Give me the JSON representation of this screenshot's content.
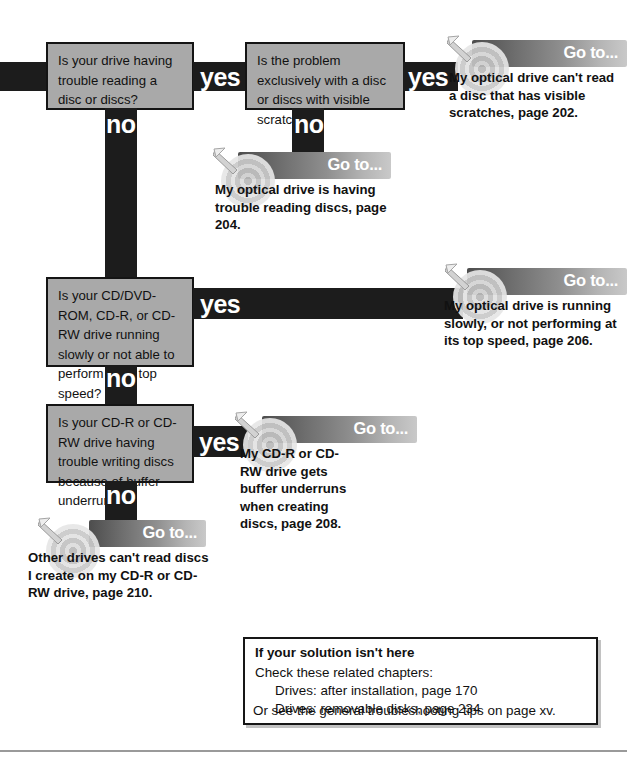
{
  "page": {
    "flow_type": "troubleshooting-flowchart",
    "topic": "Optical drive problems"
  },
  "decisions": [
    {
      "id": "q1",
      "text": "Is your drive having trouble reading a disc or discs?",
      "yes_label": "yes",
      "no_label": "no"
    },
    {
      "id": "q2",
      "text": "Is the problem exclusively with a disc or discs with visible scratches?",
      "yes_label": "yes",
      "no_label": "no"
    },
    {
      "id": "q3",
      "text": "Is your CD/DVD-ROM, CD-R, or CD-RW drive running slowly or not able to perform at its top speed?",
      "yes_label": "yes",
      "no_label": "no"
    },
    {
      "id": "q4",
      "text": "Is your CD-R or CD-RW drive having trouble writing discs because of buffer underruns?",
      "yes_label": "yes",
      "no_label": "no"
    }
  ],
  "outcomes": [
    {
      "id": "out1",
      "header": "Go to...",
      "body": "My optical drive can't read a disc that has visible scratches, page 202.",
      "icon": "target-dart-icon"
    },
    {
      "id": "out2",
      "header": "Go to...",
      "body": "My optical drive is having trouble reading discs, page 204.",
      "icon": "target-dart-icon"
    },
    {
      "id": "out3",
      "header": "Go to...",
      "body": "My optical drive is running slowly, or not performing at its top speed, page 206.",
      "icon": "target-dart-icon"
    },
    {
      "id": "out4",
      "header": "Go to...",
      "body": "My CD-R or CD-RW drive gets buffer underruns when creating discs, page 208.",
      "icon": "target-dart-icon"
    },
    {
      "id": "out5",
      "header": "Go to...",
      "body": "Other drives can't read discs I create on my CD-R or CD-RW drive, page 210.",
      "icon": "target-dart-icon"
    }
  ],
  "note": {
    "title": "If your solution isn't here",
    "line1": "Check these related chapters:",
    "line2": "Drives: after installation, page 170",
    "line3": "Drives: removable disks, page 234",
    "line4": "Or see the general troubleshooting tips on page xv."
  },
  "colors": {
    "connector": "#1c1c1c",
    "question_fill": "#a9a9a9",
    "question_border": "#141414",
    "goto_header_dark": "#4d4d4d",
    "goto_header_light": "#c9c9c9",
    "label_text": "#ffffff"
  }
}
